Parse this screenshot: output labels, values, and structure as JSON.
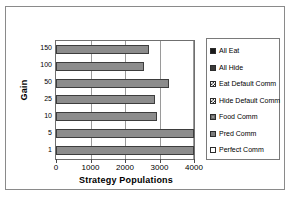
{
  "figure": {
    "border_color": "#8a8a8a",
    "background": "#ffffff"
  },
  "chart_data": {
    "type": "bar",
    "orientation": "horizontal",
    "title": "",
    "xlabel": "Strategy Populations",
    "ylabel": "Gain",
    "categories": [
      "1",
      "5",
      "10",
      "25",
      "50",
      "100",
      "150"
    ],
    "categories_top_to_bottom": [
      "150",
      "100",
      "50",
      "25",
      "10",
      "5",
      "1"
    ],
    "values": [
      4000,
      4000,
      2940,
      2870,
      3280,
      2550,
      2700
    ],
    "values_top_to_bottom": [
      2700,
      2550,
      3280,
      2870,
      2940,
      4000,
      4000
    ],
    "xlim": [
      0,
      4000
    ],
    "xticks": [
      0,
      1000,
      2000,
      3000,
      4000
    ],
    "xtick_labels": [
      "0",
      "1000",
      "2000",
      "3000",
      "4000"
    ],
    "ytick_labels": [
      "150",
      "100",
      "50",
      "25",
      "10",
      "5",
      "1"
    ],
    "grid": "vertical",
    "legend_position": "right",
    "bar_color": "#8c8c8c",
    "bar_edge_color": "#3d3d3d",
    "legend": [
      {
        "label": "All Eat",
        "swatch": "sw-solid-black",
        "color": "#1a1a1a"
      },
      {
        "label": "All Hide",
        "swatch": "sw-dark",
        "color": "#3a3a3a"
      },
      {
        "label": "Eat Default Comm",
        "swatch": "sw-check",
        "color": "#2c2c2c"
      },
      {
        "label": "Hide Default Comm",
        "swatch": "sw-check",
        "color": "#2c2c2c"
      },
      {
        "label": "Food Comm",
        "swatch": "sw-grey-ring",
        "color": "#6e6e6e"
      },
      {
        "label": "Pred Comm",
        "swatch": "sw-grey",
        "color": "#7d7d7d"
      },
      {
        "label": "Perfect Comm",
        "swatch": "sw-white",
        "color": "#ffffff"
      }
    ]
  }
}
